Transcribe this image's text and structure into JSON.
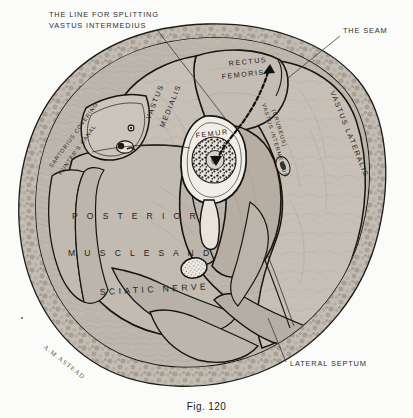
{
  "figure": {
    "caption": "Fig. 120",
    "signature": "A.M.ASTEAD"
  },
  "callouts": [
    {
      "id": "splitting-line",
      "line1": "THE LINE FOR SPLITTING",
      "line2": "VASTUS INTERMEDIUS"
    },
    {
      "id": "seam",
      "line1": "THE SEAM",
      "line2": ""
    },
    {
      "id": "lateral-septum",
      "line1": "LATERAL SEPTUM",
      "line2": ""
    }
  ],
  "structures": [
    {
      "id": "rectus-femoris",
      "line1": "RECTUS",
      "line2": "FEMORIS"
    },
    {
      "id": "vastus-medialis",
      "line1": "VASTUS",
      "line2": "MEDIALIS"
    },
    {
      "id": "vastus-lateralis",
      "line1": "VASTUS LATERALIS",
      "line2": ""
    },
    {
      "id": "vastus-intermedius",
      "line1": "VASTUS INTERMEDIUS",
      "line2": "(CRUREUS)"
    },
    {
      "id": "femur",
      "line1": "FEMUR",
      "line2": ""
    },
    {
      "id": "sartorius",
      "line1": "SARTORIUS COVERING",
      "line2": "HUNTER'S CANAL"
    },
    {
      "id": "sciatic-nerve",
      "line1": "SCIATIC NERVE",
      "line2": ""
    }
  ],
  "posterior_block": {
    "line1": "P O S T E R I O R",
    "line2": "M U S C L E S     A N D"
  },
  "colors": {
    "background": "#fbfbfa",
    "ink": "#1b1a18",
    "muscle_fill": "#b9b2a8",
    "muscle_fill_light": "#c7c1b8",
    "fat_rim": "#bdb6ac",
    "bone_cortex": "#efece6",
    "label_text": "#23211f"
  }
}
